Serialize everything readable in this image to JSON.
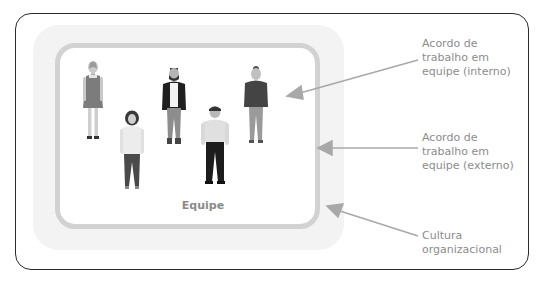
{
  "diagram": {
    "team_label": "Equipe",
    "annotations": [
      {
        "id": "internal",
        "lines": [
          "Acordo de",
          "trabalho em",
          "equipe (interno)"
        ]
      },
      {
        "id": "external",
        "lines": [
          "Acordo de",
          "trabalho em",
          "equipe (externo)"
        ]
      },
      {
        "id": "culture",
        "lines": [
          "Cultura",
          "organizacional"
        ]
      }
    ],
    "people": [
      {
        "id": "woman-dress",
        "description": "woman in dress"
      },
      {
        "id": "woman-white-top",
        "description": "woman in white top"
      },
      {
        "id": "man-jacket",
        "description": "bearded man in black jacket"
      },
      {
        "id": "man-white-shirt",
        "description": "man in white shirt"
      },
      {
        "id": "woman-dark-sweater",
        "description": "woman in dark sweater"
      }
    ],
    "colors": {
      "frame_border": "#2b2b2b",
      "culture_band": "#f3f3f3",
      "team_border": "#d2d2d2",
      "text": "#8c8c8c",
      "arrow": "#a8a8a8"
    }
  }
}
